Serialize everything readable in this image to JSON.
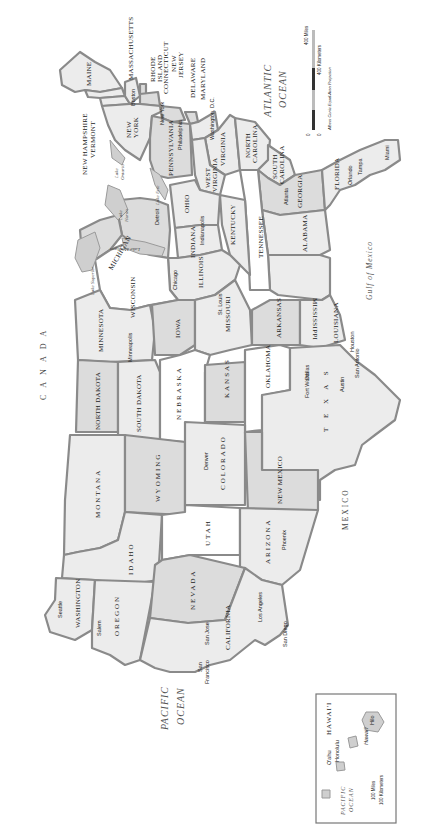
{
  "map": {
    "orientation": "rotated 90 degrees counterclockwise",
    "colors": {
      "state_light": "#ececec",
      "state_mid": "#dcdcdc",
      "state_white": "#ffffff",
      "border": "#8a8a8a",
      "background": "#ffffff"
    },
    "states": {
      "maine": "MAINE",
      "new_hampshire": "NEW HAMPSHIRE",
      "vermont": "VERMONT",
      "massachusetts": "MASSACHUSETTS",
      "rhode_island_1": "RHODE",
      "rhode_island_2": "ISLAND",
      "connecticut": "CONNECTICUT",
      "new_jersey_1": "NEW",
      "new_jersey_2": "JERSEY",
      "delaware": "DELAWARE",
      "maryland": "MARYLAND",
      "new_york_1": "NEW",
      "new_york_2": "YORK",
      "pennsylvania": "PENNSYLVANIA",
      "virginia": "VIRGINIA",
      "west_virginia_1": "WEST",
      "west_virginia_2": "VIRGINIA",
      "north_carolina_1": "NORTH",
      "north_carolina_2": "CAROLINA",
      "south_carolina_1": "SOUTH",
      "south_carolina_2": "CAROLINA",
      "georgia": "GEORGIA",
      "florida": "FLORIDA",
      "alabama": "ALABAMA",
      "mississippi": "MISSISSIPPI",
      "tennessee": "TENNESSEE",
      "kentucky": "KENTUCKY",
      "ohio": "OHIO",
      "indiana": "INDIANA",
      "illinois": "ILLINOIS",
      "michigan": "MICHIGAN",
      "wisconsin": "WISCONSIN",
      "minnesota": "MINNESOTA",
      "iowa": "IOWA",
      "missouri": "MISSOURI",
      "arkansas": "ARKANSAS",
      "louisiana": "LOUISIANA",
      "north_dakota": "NORTH DAKOTA",
      "south_dakota": "SOUTH DAKOTA",
      "nebraska": "NEBRASKA",
      "kansas": "KANSAS",
      "oklahoma": "OKLAHOMA",
      "texas": "T E X A S",
      "montana": "MONTANA",
      "wyoming": "WYOMING",
      "colorado": "COLORADO",
      "new_mexico": "NEW MEXICO",
      "idaho": "IDAHO",
      "utah": "UTAH",
      "arizona": "ARIZONA",
      "washington": "WASHINGTON",
      "oregon": "OREGON",
      "nevada": "NEVADA",
      "california": "CALIFORNIA"
    },
    "cities": {
      "boston": "Boston",
      "new_york": "New York",
      "philadelphia": "Philadelphia",
      "washington_dc": "Washington, D.C.",
      "atlanta": "Atlanta",
      "orlando": "Orlando",
      "tampa": "Tampa",
      "miami": "Miami",
      "detroit": "Detroit",
      "indianapolis": "Indianapolis",
      "chicago": "Chicago",
      "st_louis": "St. Louis",
      "minneapolis": "Minneapolis",
      "houston": "Houston",
      "dallas": "Dallas",
      "fort_worth": "Fort Worth",
      "austin": "Austin",
      "san_antonio": "San Antonio",
      "denver": "Denver",
      "phoenix": "Phoenix",
      "seattle": "Seattle",
      "salem": "Salem",
      "san_jose": "San Jose",
      "san_francisco_1": "San",
      "san_francisco_2": "Francisco",
      "los_angeles": "Los Angeles",
      "san_diego": "San Diego"
    },
    "water": {
      "atlantic_1": "ATLANTIC",
      "atlantic_2": "OCEAN",
      "pacific_1": "PACIFIC",
      "pacific_2": "OCEAN",
      "gulf": "Gulf of Mexico",
      "lake_ontario_1": "Lake",
      "lake_ontario_2": "Ontario",
      "lake_erie": "Lake Erie",
      "lake_huron_1": "Lake",
      "lake_huron_2": "Huron",
      "lake_michigan": "Lake Michigan",
      "lake_superior": "Lake Superior"
    },
    "countries": {
      "canada": "CANADA",
      "mexico": "MEXICO"
    },
    "scale": {
      "miles_label": "400 Miles",
      "km_label": "400 Kilometers",
      "zero_1": "0",
      "zero_2": "0",
      "projection": "Albers Conic Equal-Area Projection"
    },
    "hawaii_inset": {
      "title": "HAWAI'I",
      "oahu": "O'ahu",
      "honolulu": "Honolulu",
      "hawaii_island": "Hawai'i",
      "hilo": "Hilo",
      "ocean_1": "PACIFIC",
      "ocean_2": "OCEAN",
      "scale_miles": "100 Miles",
      "scale_km": "100 Kilometers",
      "zero_1": "0",
      "zero_2": "0"
    }
  }
}
